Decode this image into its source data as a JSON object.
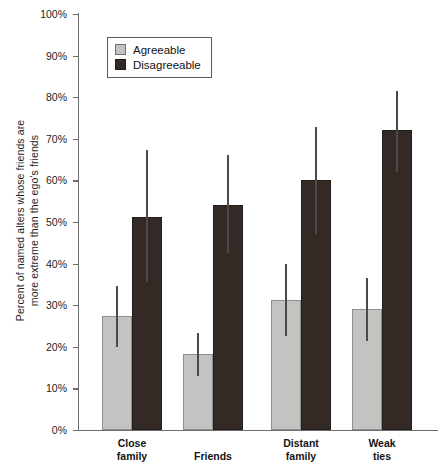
{
  "chart_data": {
    "type": "bar",
    "title": "",
    "xlabel": "",
    "ylabel_lines": [
      "Percent of named alters whose friends are",
      "more extreme than the ego's friends"
    ],
    "ylabel": "Percent of named alters whose friends are more extreme than the ego's friends",
    "categories": [
      "Close family",
      "Friends",
      "Distant family",
      "Weak ties"
    ],
    "category_lines": [
      [
        "Close",
        "family"
      ],
      [
        "Friends",
        ""
      ],
      [
        "Distant",
        "family"
      ],
      [
        "Weak",
        "ties"
      ]
    ],
    "ylim": [
      0,
      100
    ],
    "yticks": [
      0,
      10,
      20,
      30,
      40,
      50,
      60,
      70,
      80,
      90,
      100
    ],
    "ytick_labels": [
      "0%",
      "10%",
      "20%",
      "30%",
      "40%",
      "50%",
      "60%",
      "70%",
      "80%",
      "90%",
      "100%"
    ],
    "grid": false,
    "legend_position": "upper-left-inside",
    "series": [
      {
        "name": "Agreeable",
        "color": "#c3c3c1",
        "values": [
          27.5,
          18.3,
          31.2,
          29.0
        ],
        "err_low": [
          20.0,
          13.0,
          22.5,
          21.5
        ],
        "err_high": [
          34.5,
          23.3,
          40.0,
          36.5
        ]
      },
      {
        "name": "Disagreeable",
        "color": "#342a25",
        "values": [
          51.3,
          54.2,
          60.0,
          72.0
        ],
        "err_low": [
          35.5,
          42.5,
          47.0,
          62.0
        ],
        "err_high": [
          67.3,
          66.0,
          72.8,
          81.5
        ]
      }
    ]
  },
  "legend": {
    "items": [
      {
        "label": "Agreeable",
        "color": "#c3c3c1"
      },
      {
        "label": "Disagreeable",
        "color": "#342a25"
      }
    ]
  }
}
